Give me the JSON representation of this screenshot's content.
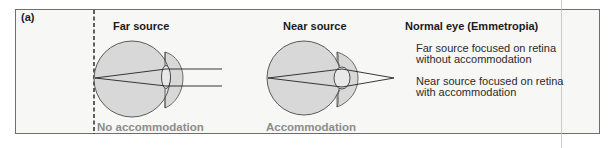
{
  "figure": {
    "panel_label": "(a)",
    "far": {
      "heading": "Far source",
      "sublabel": "No accommodation"
    },
    "near": {
      "heading": "Near source",
      "sublabel": "Accommodation"
    },
    "summary": {
      "title": "Normal eye (Emmetropia)",
      "line1": "Far source focused on retina without accommodation",
      "line2": "Near source focused on retina with accommodation"
    },
    "colors": {
      "panel_bg": "#f7f7f6",
      "eye_fill": "#d8d8d8",
      "outline": "#4a4a4a",
      "sublabel_gray": "#8c8c8c"
    }
  }
}
